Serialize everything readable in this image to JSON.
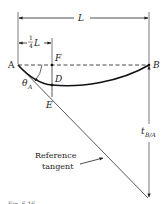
{
  "diagram": {
    "dimensions": {
      "span_label": "L",
      "quarter_label_num": "1",
      "quarter_label_den": "4",
      "quarter_label_var": "L"
    },
    "points": {
      "A": "A",
      "B": "B",
      "F": "F",
      "D": "D",
      "E": "E"
    },
    "angle": {
      "symbol": "θ",
      "subscript": "A"
    },
    "tangential_deviation": {
      "symbol": "t",
      "subscript": "B/A"
    },
    "annotation": {
      "line1": "Reference",
      "line2": "tangent"
    },
    "caption": "Fig. 6.16",
    "colors": {
      "line": "#2a2a2a",
      "curve": "#111111",
      "dashed": "#333333",
      "tangent": "#444444",
      "background": "#ffffff"
    }
  }
}
